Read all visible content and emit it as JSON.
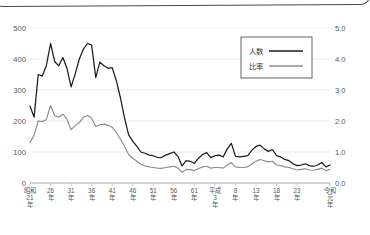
{
  "frame": {
    "kind": "rounded-panel-edge"
  },
  "chart_data": {
    "type": "line",
    "title": "",
    "subtitle": "",
    "xlabel": "",
    "ylabel": "",
    "y2label": "",
    "grid": true,
    "legend_position": "top-right",
    "ylim": [
      0,
      500
    ],
    "y2lim": [
      0.0,
      5.0
    ],
    "yticks": [
      "0",
      "100",
      "200",
      "300",
      "400",
      "500"
    ],
    "y2ticks": [
      "0.0",
      "1.0",
      "2.0",
      "3.0",
      "4.0",
      "5.0"
    ],
    "xtick_labels": [
      "昭和\n21\n年",
      "26\n年",
      "31\n年",
      "36\n年",
      "41\n年",
      "46\n年",
      "51\n年",
      "56\n年",
      "61\n年",
      "平成\n3\n年",
      "8\n年",
      "13\n年",
      "18\n年",
      "23\n年",
      "令和\n元\n年"
    ],
    "xtick_positions": [
      1946,
      1951,
      1956,
      1961,
      1966,
      1971,
      1976,
      1981,
      1986,
      1991,
      1996,
      2001,
      2006,
      2011,
      2019
    ],
    "x_start": 1946,
    "x_end": 2019,
    "series": [
      {
        "name": "人数",
        "axis": "left",
        "color": "#1c1c1c",
        "x": [
          1946,
          1947,
          1948,
          1949,
          1950,
          1951,
          1952,
          1953,
          1954,
          1955,
          1956,
          1957,
          1958,
          1959,
          1960,
          1961,
          1962,
          1963,
          1964,
          1965,
          1966,
          1967,
          1968,
          1969,
          1970,
          1971,
          1972,
          1973,
          1974,
          1975,
          1976,
          1977,
          1978,
          1979,
          1980,
          1981,
          1982,
          1983,
          1984,
          1985,
          1986,
          1987,
          1988,
          1989,
          1990,
          1991,
          1992,
          1993,
          1994,
          1995,
          1996,
          1997,
          1998,
          1999,
          2000,
          2001,
          2002,
          2003,
          2004,
          2005,
          2006,
          2007,
          2008,
          2009,
          2010,
          2011,
          2012,
          2013,
          2014,
          2015,
          2016,
          2017,
          2018,
          2019
        ],
        "values": [
          248,
          212,
          350,
          345,
          380,
          450,
          392,
          378,
          405,
          370,
          310,
          352,
          400,
          432,
          450,
          445,
          340,
          390,
          378,
          370,
          372,
          330,
          275,
          210,
          155,
          135,
          118,
          100,
          96,
          90,
          88,
          83,
          82,
          90,
          95,
          100,
          86,
          55,
          72,
          70,
          63,
          80,
          92,
          98,
          82,
          88,
          90,
          84,
          110,
          128,
          86,
          84,
          86,
          88,
          106,
          118,
          122,
          110,
          102,
          108,
          88,
          84,
          76,
          72,
          62,
          56,
          58,
          62,
          56,
          54,
          58,
          66,
          52,
          58
        ]
      },
      {
        "name": "比率",
        "axis": "right",
        "color": "#8d8d8d",
        "x": [
          1946,
          1947,
          1948,
          1949,
          1950,
          1951,
          1952,
          1953,
          1954,
          1955,
          1956,
          1957,
          1958,
          1959,
          1960,
          1961,
          1962,
          1963,
          1964,
          1965,
          1966,
          1967,
          1968,
          1969,
          1970,
          1971,
          1972,
          1973,
          1974,
          1975,
          1976,
          1977,
          1978,
          1979,
          1980,
          1981,
          1982,
          1983,
          1984,
          1985,
          1986,
          1987,
          1988,
          1989,
          1990,
          1991,
          1992,
          1993,
          1994,
          1995,
          1996,
          1997,
          1998,
          1999,
          2000,
          2001,
          2002,
          2003,
          2004,
          2005,
          2006,
          2007,
          2008,
          2009,
          2010,
          2011,
          2012,
          2013,
          2014,
          2015,
          2016,
          2017,
          2018,
          2019
        ],
        "values": [
          1.3,
          1.55,
          2.0,
          1.98,
          2.05,
          2.5,
          2.18,
          2.12,
          2.22,
          2.05,
          1.72,
          1.85,
          1.95,
          2.12,
          2.18,
          2.1,
          1.82,
          1.88,
          1.9,
          1.86,
          1.8,
          1.62,
          1.42,
          1.18,
          0.92,
          0.8,
          0.7,
          0.6,
          0.55,
          0.52,
          0.5,
          0.48,
          0.47,
          0.5,
          0.52,
          0.54,
          0.48,
          0.34,
          0.44,
          0.43,
          0.4,
          0.47,
          0.52,
          0.54,
          0.48,
          0.5,
          0.5,
          0.48,
          0.58,
          0.66,
          0.52,
          0.5,
          0.5,
          0.52,
          0.62,
          0.7,
          0.76,
          0.72,
          0.68,
          0.7,
          0.58,
          0.56,
          0.52,
          0.5,
          0.46,
          0.42,
          0.44,
          0.46,
          0.42,
          0.41,
          0.44,
          0.48,
          0.4,
          0.44
        ]
      }
    ]
  },
  "legend": {
    "items": [
      {
        "label": "人数",
        "style": "solid-dark"
      },
      {
        "label": "比率",
        "style": "solid-gray"
      }
    ]
  }
}
